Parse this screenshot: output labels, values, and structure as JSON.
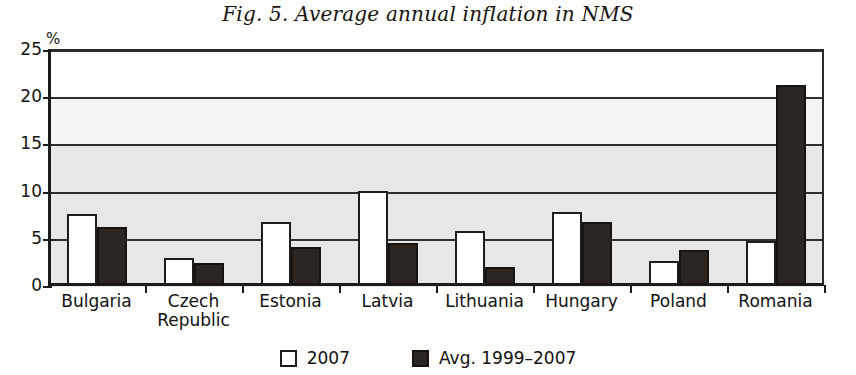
{
  "chart_data": {
    "type": "bar",
    "title": "Fig. 5. Average annual inflation in NMS",
    "xlabel": "",
    "ylabel": "%",
    "ylim": [
      0,
      25
    ],
    "yticks": [
      0,
      5,
      10,
      15,
      20,
      25
    ],
    "grid": true,
    "legend_position": "bottom",
    "categories": [
      "Bulgaria",
      "Czech\nRepublic",
      "Estonia",
      "Latvia",
      "Lithuania",
      "Hungary",
      "Poland",
      "Romania"
    ],
    "series": [
      {
        "name": "2007",
        "color": "#ffffff",
        "values": [
          7.5,
          2.9,
          6.7,
          10.0,
          5.7,
          7.7,
          2.5,
          4.7
        ]
      },
      {
        "name": "Avg. 1999–2007",
        "color": "#2b2622",
        "values": [
          6.1,
          2.3,
          4.0,
          4.5,
          1.9,
          6.7,
          3.7,
          21.2
        ]
      }
    ]
  },
  "axis": {
    "unit_label": "%",
    "tick_labels": [
      "25",
      "20",
      "15",
      "10",
      "5",
      "0"
    ]
  },
  "legend": {
    "items": [
      {
        "swatch": "legend-swatch-light",
        "label": "2007"
      },
      {
        "swatch": "legend-swatch-dark",
        "label": "Avg. 1999–2007"
      }
    ]
  }
}
